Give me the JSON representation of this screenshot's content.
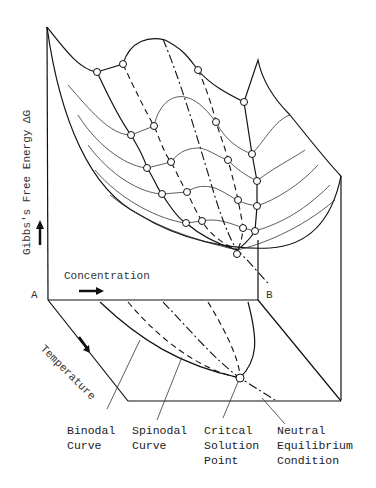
{
  "figure": {
    "type": "3D Gibbs free energy surface / phase diagram",
    "axes": {
      "y_label": "Gibbs's Free Energy ΔG",
      "x_label": "Concentration",
      "z_label": "Temperature",
      "corner_a": "A",
      "corner_b": "B"
    },
    "annotations": [
      {
        "line1": "Binodal",
        "line2": "Curve",
        "line3": ""
      },
      {
        "line1": "Spinodal",
        "line2": "Curve",
        "line3": ""
      },
      {
        "line1": "Critcal",
        "line2": "Solution",
        "line3": "Point"
      },
      {
        "line1": "Neutral",
        "line2": "Equilibrium",
        "line3": "Condition"
      }
    ]
  }
}
